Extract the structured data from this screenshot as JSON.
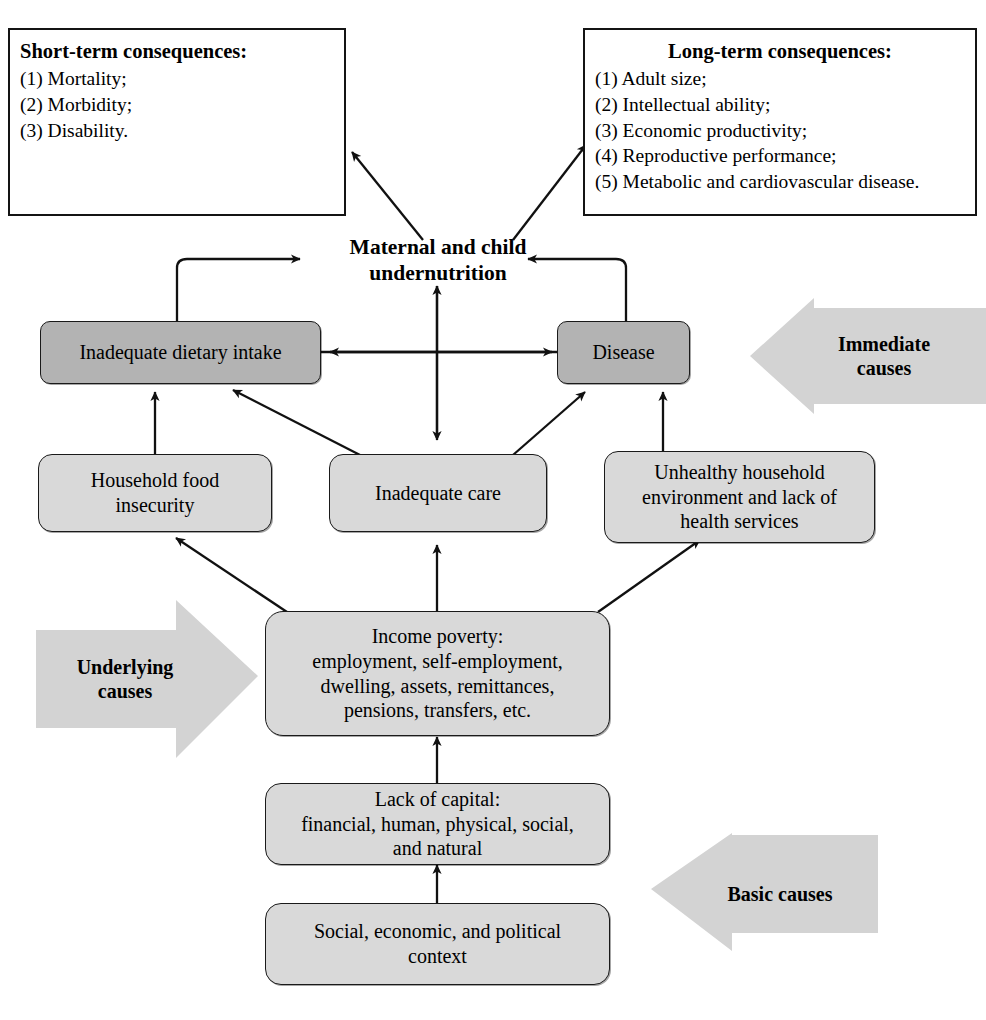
{
  "diagram": {
    "title_center": "Maternal and child\nundernutrition",
    "title_center_line1": "Maternal and child",
    "title_center_line2": "undernutrition",
    "colors": {
      "immediate_box_fill": "#b3b3b3",
      "other_box_fill": "#d9d9d9",
      "band_arrow_fill": "#d3d3d3",
      "border": "#1a1a1a",
      "text": "#000000",
      "page_background": "#ffffff"
    }
  },
  "consequences": {
    "short_term": {
      "heading": "Short-term consequences:",
      "items": [
        "(1) Mortality;",
        "(2) Morbidity;",
        "(3) Disability."
      ]
    },
    "long_term": {
      "heading": "Long-term consequences:",
      "items": [
        "(1) Adult size;",
        "(2) Intellectual ability;",
        "(3) Economic productivity;",
        "(4) Reproductive performance;",
        "(5) Metabolic and cardiovascular disease."
      ]
    }
  },
  "nodes": {
    "inadequate_dietary_intake": "Inadequate dietary intake",
    "disease": "Disease",
    "household_food_insecurity_line1": "Household food",
    "household_food_insecurity_line2": "insecurity",
    "inadequate_care": "Inadequate care",
    "unhealthy_household_line1": "Unhealthy household",
    "unhealthy_household_line2": "environment and lack of",
    "unhealthy_household_line3": "health services",
    "income_poverty_line1": "Income poverty:",
    "income_poverty_line2": "employment, self-employment,",
    "income_poverty_line3": "dwelling, assets, remittances,",
    "income_poverty_line4": "pensions, transfers, etc.",
    "lack_of_capital_line1": "Lack of capital:",
    "lack_of_capital_line2": "financial, human, physical, social,",
    "lack_of_capital_line3": "and natural",
    "context_line1": "Social, economic, and political",
    "context_line2": "context"
  },
  "bands": {
    "immediate_line1": "Immediate",
    "immediate_line2": "causes",
    "underlying_line1": "Underlying",
    "underlying_line2": "causes",
    "basic": "Basic causes"
  }
}
